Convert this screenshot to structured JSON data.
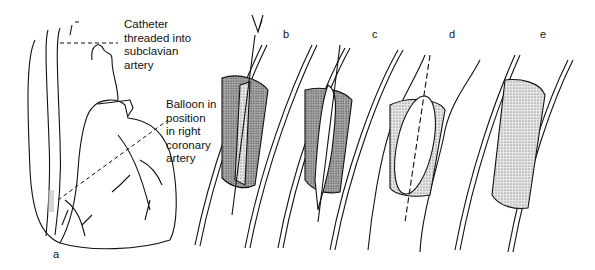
{
  "figure": {
    "annotations": [
      {
        "id": "catheter",
        "lines": [
          "Catheter",
          "threaded into",
          "subclavian",
          "artery"
        ]
      },
      {
        "id": "balloon",
        "lines": [
          "Balloon in",
          "position",
          "in right",
          "coronary",
          "artery"
        ]
      }
    ],
    "panels": [
      {
        "id": "a",
        "label": "a",
        "depicts": "heart with catheter"
      },
      {
        "id": "b",
        "label": "b",
        "depicts": "guidewire crossing plaque"
      },
      {
        "id": "c",
        "label": "c",
        "depicts": "deflated balloon within plaque"
      },
      {
        "id": "d",
        "label": "d",
        "depicts": "inflated balloon compressing plaque"
      },
      {
        "id": "e",
        "label": "e",
        "depicts": "widened artery after procedure"
      }
    ],
    "colors": {
      "ink": "#111111",
      "plaque_dark": "#9a9a9a",
      "plaque_light": "#d8d8d8",
      "background": "#ffffff"
    }
  }
}
